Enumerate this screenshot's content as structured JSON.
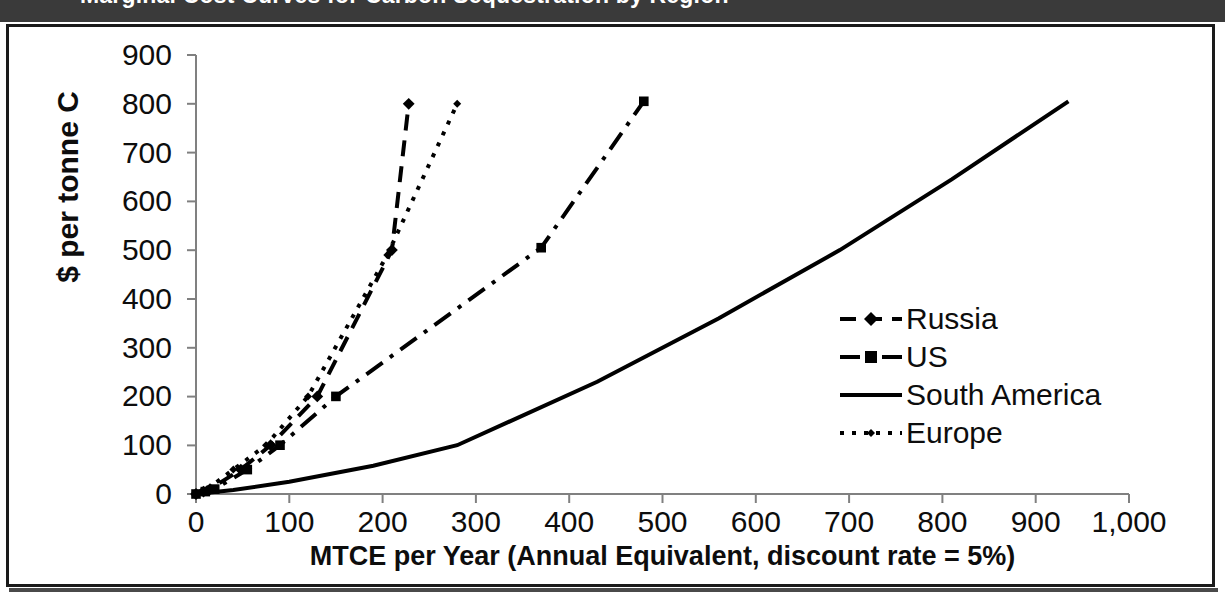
{
  "title_banner": {
    "text": "Marginal Cost Curves for Carbon Sequestration by Region",
    "background_color": "#3a3a3a",
    "text_color": "#ffffff"
  },
  "axes": {
    "x_title": "MTCE per Year (Annual Equivalent, discount rate = 5%)",
    "y_title": "$ per tonne C",
    "x_ticks": [
      "0",
      "100",
      "200",
      "300",
      "400",
      "500",
      "600",
      "700",
      "800",
      "900",
      "1,000"
    ],
    "y_ticks": [
      "0",
      "100",
      "200",
      "300",
      "400",
      "500",
      "600",
      "700",
      "800",
      "900"
    ]
  },
  "legend": {
    "position": "inside-right",
    "entries": [
      {
        "label": "Russia",
        "style": "dashed-with-diamond-marker"
      },
      {
        "label": "US",
        "style": "dash-dot-with-square-marker"
      },
      {
        "label": "South America",
        "style": "solid-no-marker"
      },
      {
        "label": "Europe",
        "style": "dotted-with-small-marker"
      }
    ]
  },
  "chart_data": {
    "type": "line",
    "title": "Marginal Cost Curves for Carbon Sequestration by Region",
    "xlabel": "MTCE per Year (Annual Equivalent, discount rate = 5%)",
    "ylabel": "$ per tonne C",
    "xlim": [
      0,
      1000
    ],
    "ylim": [
      0,
      900
    ],
    "x_tick_values": [
      0,
      100,
      200,
      300,
      400,
      500,
      600,
      700,
      800,
      900,
      1000
    ],
    "y_tick_values": [
      0,
      100,
      200,
      300,
      400,
      500,
      600,
      700,
      800,
      900
    ],
    "grid": false,
    "legend_position": "center right inside plot",
    "line_color": "#000000",
    "series": [
      {
        "name": "Russia",
        "marker": "diamond",
        "dash": "dashed",
        "points": [
          [
            0,
            0
          ],
          [
            8,
            5
          ],
          [
            15,
            10
          ],
          [
            48,
            50
          ],
          [
            80,
            100
          ],
          [
            130,
            200
          ],
          [
            210,
            500
          ],
          [
            228,
            800
          ]
        ]
      },
      {
        "name": "US",
        "marker": "square",
        "dash": "dash-dot",
        "points": [
          [
            0,
            0
          ],
          [
            10,
            5
          ],
          [
            20,
            10
          ],
          [
            55,
            50
          ],
          [
            90,
            100
          ],
          [
            150,
            200
          ],
          [
            370,
            505
          ],
          [
            480,
            805
          ]
        ]
      },
      {
        "name": "South America",
        "marker": "none",
        "dash": "solid",
        "points": [
          [
            0,
            0
          ],
          [
            40,
            8
          ],
          [
            100,
            25
          ],
          [
            190,
            58
          ],
          [
            280,
            100
          ],
          [
            430,
            230
          ],
          [
            560,
            360
          ],
          [
            690,
            500
          ],
          [
            810,
            645
          ],
          [
            935,
            805
          ]
        ]
      },
      {
        "name": "Europe",
        "marker": "small-diamond",
        "dash": "dotted",
        "points": [
          [
            0,
            0
          ],
          [
            6,
            5
          ],
          [
            12,
            10
          ],
          [
            40,
            50
          ],
          [
            75,
            100
          ],
          [
            120,
            200
          ],
          [
            205,
            490
          ],
          [
            280,
            800
          ]
        ]
      }
    ]
  }
}
